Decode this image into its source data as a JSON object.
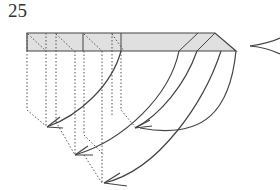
{
  "diagram": {
    "step_number": "25",
    "colors": {
      "strip_fill": "#e0e0e0",
      "line": "#444444",
      "dotted": "#555555",
      "background": "#ffffff"
    },
    "symbols": [
      "pleat-strip",
      "valley-fold-dotted-lines",
      "fold-arrows",
      "view-pinch-arrow"
    ]
  }
}
